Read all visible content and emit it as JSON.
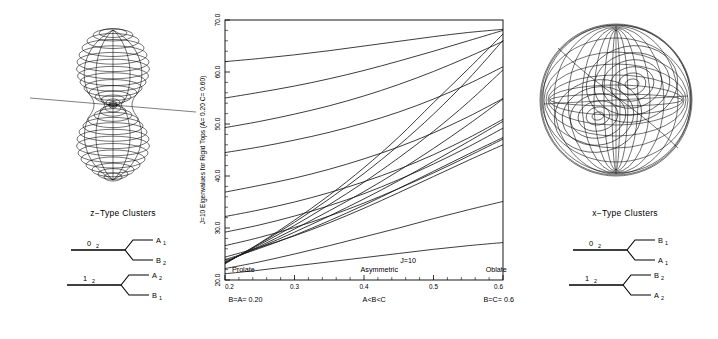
{
  "figure": {
    "left_panel": {
      "shape_name": "z-type-rotational-energy-surface",
      "description": "double-lobed prolate-like rotational energy surface with trajectory"
    },
    "right_panel": {
      "shape_name": "x-type-rotational-energy-surface",
      "description": "spherical rotational energy surface with nested trajectories"
    },
    "left_cluster": {
      "title": "z−Type Clusters",
      "levels": [
        {
          "origin": "0",
          "origin_sub": "2",
          "upper": "A",
          "upper_sub": "1",
          "lower": "B",
          "lower_sub": "2"
        },
        {
          "origin": "1",
          "origin_sub": "2",
          "upper": "A",
          "upper_sub": "2",
          "lower": "B",
          "lower_sub": "1"
        }
      ]
    },
    "right_cluster": {
      "title": "x−Type Clusters",
      "levels": [
        {
          "origin": "0",
          "origin_sub": "2",
          "upper": "B",
          "upper_sub": "1",
          "lower": "A",
          "lower_sub": "1"
        },
        {
          "origin": "1",
          "origin_sub": "2",
          "upper": "B",
          "upper_sub": "2",
          "lower": "A",
          "lower_sub": "2"
        }
      ]
    }
  },
  "chart_data": {
    "type": "line",
    "title": "",
    "ylabel": "J=10 Eigenvalues for Rigid Tops (A= 0.20  C= 0.60)",
    "xlabel": "",
    "xlim": [
      0.2,
      0.6
    ],
    "ylim": [
      20.0,
      70.0
    ],
    "grid": false,
    "legend": false,
    "xticks": [
      "0.2",
      "0.3",
      "0.4",
      "0.5",
      "0.6"
    ],
    "xtick_values": [
      0.2,
      0.3,
      0.4,
      0.5,
      0.6
    ],
    "yticks": [
      "20.0",
      "30.0",
      "40.0",
      "50.0",
      "60.0",
      "70.0"
    ],
    "ytick_values": [
      20.0,
      30.0,
      40.0,
      50.0,
      60.0,
      70.0
    ],
    "annotations": [
      {
        "text": "Prolate",
        "x": 0.21,
        "y": 21.6
      },
      {
        "text": "Asymmetric",
        "x": 0.395,
        "y": 21.6
      },
      {
        "text": "Oblate",
        "x": 0.575,
        "y": 21.6
      },
      {
        "text": "J=10",
        "x": 0.452,
        "y": 23.3
      }
    ],
    "x_bottom_labels": [
      {
        "text": "B=A=  0.20",
        "x": 0.205
      },
      {
        "text": "A<B<C",
        "x": 0.398
      },
      {
        "text": "B=C=  0.60",
        "x": 0.572
      }
    ],
    "x": [
      0.2,
      0.25,
      0.3,
      0.35,
      0.4,
      0.45,
      0.5,
      0.55,
      0.6
    ],
    "series": [
      {
        "name": "level-1",
        "values": [
          62.0,
          62.6,
          63.3,
          64.1,
          65.0,
          65.9,
          66.8,
          67.6,
          68.2
        ]
      },
      {
        "name": "level-2",
        "values": [
          55.0,
          56.1,
          57.3,
          58.7,
          60.3,
          62.1,
          64.0,
          66.0,
          68.0
        ]
      },
      {
        "name": "level-3",
        "values": [
          49.3,
          50.5,
          51.9,
          53.5,
          55.4,
          57.6,
          60.1,
          62.9,
          65.9
        ]
      },
      {
        "name": "level-4",
        "values": [
          44.5,
          45.6,
          46.9,
          48.4,
          50.2,
          52.3,
          54.8,
          57.7,
          61.0
        ]
      },
      {
        "name": "level-5",
        "values": [
          36.9,
          38.2,
          39.6,
          41.3,
          43.3,
          45.6,
          48.3,
          51.4,
          54.9
        ]
      },
      {
        "name": "level-6",
        "values": [
          32.2,
          33.5,
          35.0,
          36.8,
          38.9,
          41.3,
          44.1,
          47.3,
          50.9
        ]
      },
      {
        "name": "level-7",
        "values": [
          29.2,
          30.6,
          32.3,
          34.3,
          36.6,
          39.3,
          42.3,
          45.6,
          49.2
        ]
      },
      {
        "name": "level-8",
        "values": [
          26.6,
          28.2,
          30.1,
          32.3,
          34.8,
          37.6,
          40.6,
          43.8,
          47.1
        ]
      },
      {
        "name": "level-9",
        "values": [
          24.4,
          26.3,
          28.5,
          31.0,
          33.8,
          36.8,
          39.9,
          43.0,
          46.0
        ]
      },
      {
        "name": "level-10",
        "values": [
          23.9,
          26.1,
          28.6,
          31.4,
          34.4,
          37.6,
          40.9,
          44.2,
          47.4
        ]
      },
      {
        "name": "level-11",
        "values": [
          23.6,
          26.3,
          29.2,
          32.3,
          35.6,
          39.1,
          42.8,
          46.6,
          50.5
        ]
      },
      {
        "name": "level-12",
        "values": [
          23.4,
          26.5,
          29.8,
          33.3,
          37.0,
          41.0,
          45.3,
          49.9,
          54.8
        ]
      },
      {
        "name": "level-13",
        "values": [
          23.3,
          26.8,
          30.5,
          34.5,
          38.8,
          43.5,
          48.6,
          54.2,
          60.4
        ]
      },
      {
        "name": "level-14",
        "values": [
          23.2,
          27.0,
          31.1,
          35.6,
          40.5,
          45.9,
          51.9,
          58.6,
          66.1
        ]
      },
      {
        "name": "level-15",
        "values": [
          23.1,
          27.1,
          31.5,
          36.3,
          41.6,
          47.5,
          54.1,
          60.6,
          67.3
        ]
      },
      {
        "name": "level-16",
        "values": [
          22.2,
          23.5,
          25.0,
          26.6,
          28.3,
          30.0,
          31.8,
          33.5,
          35.1
        ]
      },
      {
        "name": "level-17",
        "values": [
          21.2,
          21.9,
          22.7,
          23.5,
          24.3,
          25.1,
          25.9,
          26.6,
          27.2
        ]
      }
    ]
  }
}
